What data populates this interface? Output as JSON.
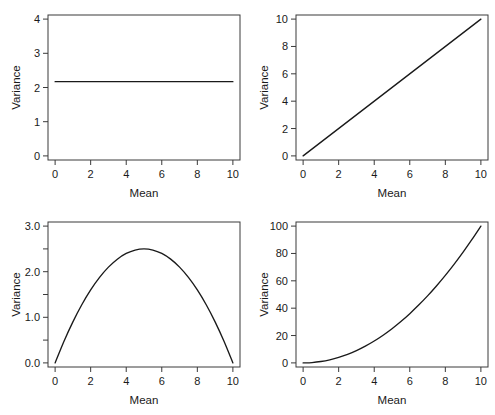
{
  "figure": {
    "title": "",
    "background": "#ffffff",
    "line_color": "#1a1a1a",
    "axis_color": "#3a3a3a",
    "layout": "2x2 grid of panels"
  },
  "chart_data": [
    {
      "type": "line",
      "panel": "top-left",
      "title": "",
      "xlabel": "Mean",
      "ylabel": "Variance",
      "xlim": [
        -0.4,
        10.4
      ],
      "ylim": [
        -0.12,
        4.12
      ],
      "xticks": [
        0,
        2,
        4,
        6,
        8,
        10
      ],
      "xticklabels": [
        "0",
        "2",
        "4",
        "6",
        "8",
        "10"
      ],
      "yticks": [
        0,
        1,
        2,
        3,
        4
      ],
      "yticklabels": [
        "0",
        "1",
        "2",
        "3",
        "4"
      ],
      "grid": false,
      "legend": null,
      "relationship": "constant variance",
      "series": [
        {
          "name": "constant",
          "x": [
            0,
            1,
            2,
            3,
            4,
            5,
            6,
            7,
            8,
            9,
            10
          ],
          "values": [
            2.17,
            2.17,
            2.17,
            2.17,
            2.17,
            2.17,
            2.17,
            2.17,
            2.17,
            2.17,
            2.17
          ]
        }
      ]
    },
    {
      "type": "line",
      "panel": "top-right",
      "title": "",
      "xlabel": "Mean",
      "ylabel": "Variance",
      "xlim": [
        -0.4,
        10.4
      ],
      "ylim": [
        -0.3,
        10.3
      ],
      "xticks": [
        0,
        2,
        4,
        6,
        8,
        10
      ],
      "xticklabels": [
        "0",
        "2",
        "4",
        "6",
        "8",
        "10"
      ],
      "yticks": [
        0,
        2,
        4,
        6,
        8,
        10
      ],
      "yticklabels": [
        "0",
        "2",
        "4",
        "6",
        "8",
        "10"
      ],
      "grid": false,
      "legend": null,
      "relationship": "variance proportional to mean",
      "series": [
        {
          "name": "linear",
          "x": [
            0,
            1,
            2,
            3,
            4,
            5,
            6,
            7,
            8,
            9,
            10
          ],
          "values": [
            0,
            1,
            2,
            3,
            4,
            5,
            6,
            7,
            8,
            9,
            10
          ]
        }
      ]
    },
    {
      "type": "line",
      "panel": "bottom-left",
      "title": "",
      "xlabel": "Mean",
      "ylabel": "Variance",
      "xlim": [
        -0.4,
        10.4
      ],
      "ylim": [
        -0.09,
        3.09
      ],
      "xticks": [
        0,
        2,
        4,
        6,
        8,
        10
      ],
      "xticklabels": [
        "0",
        "2",
        "4",
        "6",
        "8",
        "10"
      ],
      "yticks": [
        0.0,
        0.5,
        1.0,
        1.5,
        2.0,
        2.5,
        3.0
      ],
      "yticklabels": [
        "0.0",
        "",
        "1.0",
        "",
        "2.0",
        "",
        "3.0"
      ],
      "grid": false,
      "legend": null,
      "relationship": "binomial variance, peaks at mean = 5",
      "series": [
        {
          "name": "binomial",
          "x": [
            0,
            0.5,
            1,
            1.5,
            2,
            2.5,
            3,
            3.5,
            4,
            4.5,
            5,
            5.5,
            6,
            6.5,
            7,
            7.5,
            8,
            8.5,
            9,
            9.5,
            10
          ],
          "values": [
            0,
            0.475,
            0.9,
            1.275,
            1.6,
            1.875,
            2.1,
            2.275,
            2.4,
            2.475,
            2.5,
            2.475,
            2.4,
            2.275,
            2.1,
            1.875,
            1.6,
            1.275,
            0.9,
            0.475,
            0
          ]
        }
      ]
    },
    {
      "type": "line",
      "panel": "bottom-right",
      "title": "",
      "xlabel": "Mean",
      "ylabel": "Variance",
      "xlim": [
        -0.4,
        10.4
      ],
      "ylim": [
        -3,
        103
      ],
      "xticks": [
        0,
        2,
        4,
        6,
        8,
        10
      ],
      "xticklabels": [
        "0",
        "2",
        "4",
        "6",
        "8",
        "10"
      ],
      "yticks": [
        0,
        20,
        40,
        60,
        80,
        100
      ],
      "yticklabels": [
        "0",
        "20",
        "40",
        "60",
        "80",
        "100"
      ],
      "grid": false,
      "legend": null,
      "relationship": "variance proportional to square of the mean",
      "series": [
        {
          "name": "quadratic",
          "x": [
            0,
            0.5,
            1,
            1.5,
            2,
            2.5,
            3,
            3.5,
            4,
            4.5,
            5,
            5.5,
            6,
            6.5,
            7,
            7.5,
            8,
            8.5,
            9,
            9.5,
            10
          ],
          "values": [
            0,
            0.25,
            1,
            2.25,
            4,
            6.25,
            9,
            12.25,
            16,
            20.25,
            25,
            30.25,
            36,
            42.25,
            49,
            56.25,
            64,
            72.25,
            81,
            90.25,
            100
          ]
        }
      ]
    }
  ]
}
